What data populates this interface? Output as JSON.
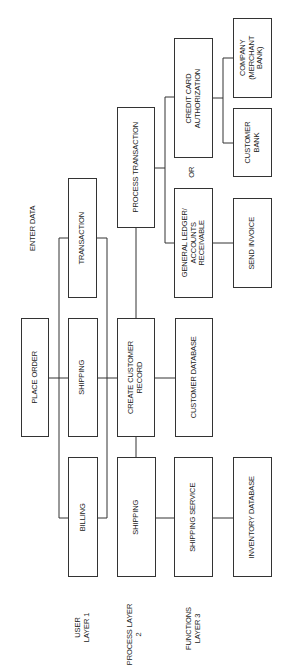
{
  "diagram": {
    "labels": {
      "enter_data": "ENTER DATA",
      "or": "OR",
      "layer1": [
        "USER",
        "LAYER 1"
      ],
      "layer2": [
        "PROCESS LAYER",
        "2"
      ],
      "layer3": [
        "FUNCTIONS",
        "LAYER 3"
      ]
    },
    "layer1": {
      "place_order": "PLACE ORDER",
      "transaction": "TRANSACTION",
      "shipping": "SHIPPING",
      "billing": "BILLING"
    },
    "layer2": {
      "process_transaction": "PROCESS TRANSACTION",
      "create_customer_record": [
        "CREATE CUSTOMER",
        "RECORD"
      ],
      "shipping": "SHIPPING"
    },
    "layer3": {
      "credit_card_authorization": [
        "CREDIT CARD",
        "AUTHORIZATION"
      ],
      "general_ledger": [
        "GENERAL LEDGER/",
        "ACCOUNTS",
        "RECEIVABLE"
      ],
      "customer_database": "CUSTOMER DATABASE",
      "shipping_service": "SHIPPING SERVICE"
    },
    "layer4": {
      "company_merchant_bank": [
        "COMPANY",
        "(MERCHANT",
        "BANK)"
      ],
      "customer_bank": [
        "CUSTOMER",
        "BANK"
      ],
      "send_invoice": "SEND INVOICE",
      "inventory_database": "INVENTORY DATABASE"
    }
  }
}
